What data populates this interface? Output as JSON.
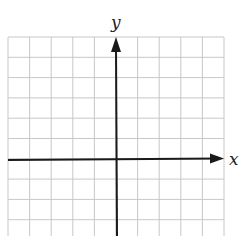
{
  "diagram": {
    "type": "coordinate-plane",
    "x_axis_label": "x",
    "y_axis_label": "y",
    "grid": {
      "columns": 10,
      "rows": 10,
      "color": "#c8c8c8",
      "left": 8,
      "top": 37,
      "right": 224,
      "bottom": 240
    },
    "axis_color": "#1a1a1a",
    "x_axis_y": 160,
    "y_axis_x": 116
  }
}
